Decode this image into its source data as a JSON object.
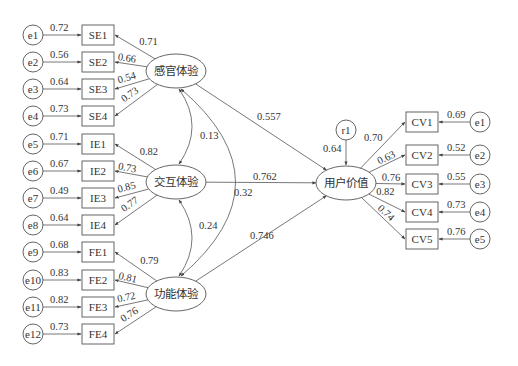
{
  "diagram": {
    "type": "structural-equation-model",
    "latent_factors": [
      {
        "id": "SE",
        "label": "感官体验",
        "cx": 176,
        "cy": 71
      },
      {
        "id": "IE",
        "label": "交互体验",
        "cx": 176,
        "cy": 182
      },
      {
        "id": "FE",
        "label": "功能体验",
        "cx": 176,
        "cy": 294
      },
      {
        "id": "CV",
        "label": "用户价值",
        "cx": 346,
        "cy": 183
      }
    ],
    "left_indicators": [
      {
        "error": "e1",
        "error_weight": "0.72",
        "indicator": "SE1",
        "loading": "0.71",
        "factor": "SE",
        "y": 35
      },
      {
        "error": "e2",
        "error_weight": "0.56",
        "indicator": "SE2",
        "loading": "0.66",
        "factor": "SE",
        "y": 62
      },
      {
        "error": "e3",
        "error_weight": "0.64",
        "indicator": "SE3",
        "loading": "0.54",
        "factor": "SE",
        "y": 89
      },
      {
        "error": "e4",
        "error_weight": "0.73",
        "indicator": "SE4",
        "loading": "0.73",
        "factor": "SE",
        "y": 116
      },
      {
        "error": "e5",
        "error_weight": "0.71",
        "indicator": "IE1",
        "loading": "0.82",
        "factor": "IE",
        "y": 144
      },
      {
        "error": "e6",
        "error_weight": "0.67",
        "indicator": "IE2",
        "loading": "0.73",
        "factor": "IE",
        "y": 171
      },
      {
        "error": "e7",
        "error_weight": "0.49",
        "indicator": "IE3",
        "loading": "0.85",
        "factor": "IE",
        "y": 198
      },
      {
        "error": "e8",
        "error_weight": "0.64",
        "indicator": "IE4",
        "loading": "0.77",
        "factor": "IE",
        "y": 225
      },
      {
        "error": "e9",
        "error_weight": "0.68",
        "indicator": "FE1",
        "loading": "0.79",
        "factor": "FE",
        "y": 252
      },
      {
        "error": "e10",
        "error_weight": "0.83",
        "indicator": "FE2",
        "loading": "0.81",
        "factor": "FE",
        "y": 280
      },
      {
        "error": "e11",
        "error_weight": "0.82",
        "indicator": "FE3",
        "loading": "0.72",
        "factor": "FE",
        "y": 307
      },
      {
        "error": "e12",
        "error_weight": "0.73",
        "indicator": "FE4",
        "loading": "0.76",
        "factor": "FE",
        "y": 334
      }
    ],
    "right_indicators": [
      {
        "error": "e1",
        "error_weight": "0.69",
        "indicator": "CV1",
        "loading": "0.70",
        "y": 122
      },
      {
        "error": "e2",
        "error_weight": "0.52",
        "indicator": "CV2",
        "loading": "0.63",
        "y": 155
      },
      {
        "error": "e3",
        "error_weight": "0.55",
        "indicator": "CV3",
        "loading": "0.76",
        "y": 184
      },
      {
        "error": "e4",
        "error_weight": "0.73",
        "indicator": "CV4",
        "loading": "0.82",
        "y": 212
      },
      {
        "error": "e5",
        "error_weight": "0.76",
        "indicator": "CV5",
        "loading": "0.74",
        "y": 239
      }
    ],
    "structural_paths": [
      {
        "from": "SE",
        "to": "CV",
        "coefficient": "0.557"
      },
      {
        "from": "IE",
        "to": "CV",
        "coefficient": "0.762"
      },
      {
        "from": "FE",
        "to": "CV",
        "coefficient": "0.746"
      }
    ],
    "correlations": [
      {
        "between": [
          "SE",
          "IE"
        ],
        "value": "0.13"
      },
      {
        "between": [
          "IE",
          "FE"
        ],
        "value": "0.24"
      },
      {
        "between": [
          "SE",
          "FE"
        ],
        "value": "0.32"
      }
    ],
    "residual": {
      "label": "r1",
      "weight": "0.64"
    },
    "colors": {
      "stroke": "#555555",
      "text": "#333333",
      "background": "#ffffff"
    }
  }
}
